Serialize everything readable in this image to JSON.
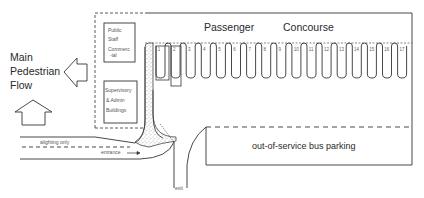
{
  "pedestrian_flow": {
    "line1": "Main",
    "line2": "Pedestrian",
    "line3": "Flow"
  },
  "buildings": {
    "top": {
      "line1": "Public",
      "line2": "Staff",
      "line3": "Commerc",
      "line4": "-ial"
    },
    "bottom": {
      "line1": "Supervisory",
      "line2": "& Admin",
      "line3": "Buildings"
    }
  },
  "concourse": {
    "word1": "Passenger",
    "word2": "Concourse"
  },
  "bays": [
    "1",
    "2",
    "3",
    "4",
    "5",
    "6",
    "7",
    "8",
    "9",
    "10",
    "11",
    "12",
    "13",
    "14",
    "15",
    "16",
    "17"
  ],
  "roads": {
    "alighting": "alighting only",
    "entrance": "entrance",
    "exit": "exit"
  },
  "parking": {
    "label": "out-of-service bus parking"
  },
  "colors": {
    "line": "#333333",
    "stipple": "#888888",
    "background": "#ffffff"
  }
}
